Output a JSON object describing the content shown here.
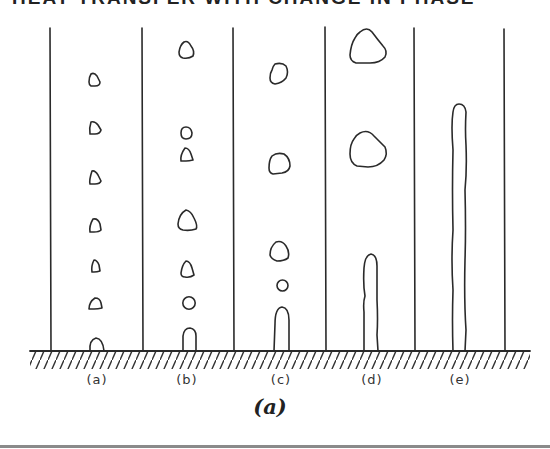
{
  "header": {
    "title": "HEAT TRANSFER WITH CHANGE IN PHASE"
  },
  "figure": {
    "caption": "(a)",
    "panel_labels": [
      "(a)",
      "(b)",
      "(c)",
      "(d)",
      "(e)"
    ],
    "panel_label_x": [
      97,
      187,
      281,
      372,
      460
    ],
    "dividers_x": [
      50,
      142,
      233,
      325,
      414,
      505
    ],
    "stroke_color": "#2a2a2a"
  }
}
